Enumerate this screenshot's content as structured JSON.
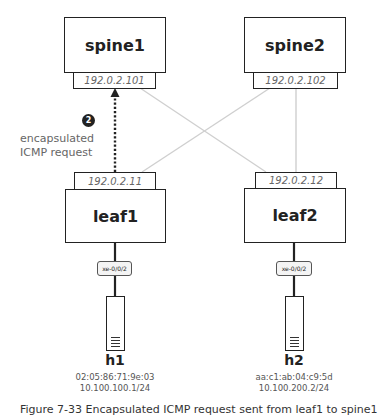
{
  "diagram": {
    "spines": [
      {
        "name": "spine1",
        "ip": "192.0.2.101"
      },
      {
        "name": "spine2",
        "ip": "192.0.2.102"
      }
    ],
    "leaves": [
      {
        "name": "leaf1",
        "ip": "192.0.2.11",
        "port": "xe-0/0/2"
      },
      {
        "name": "leaf2",
        "ip": "192.0.2.12",
        "port": "xe-0/0/2"
      }
    ],
    "hosts": [
      {
        "name": "h1",
        "mac": "02:05:86:71:9e:03",
        "ip": "10.100.100.1/24"
      },
      {
        "name": "h2",
        "mac": "aa:c1:ab:04:c9:5d",
        "ip": "10.100.200.2/24"
      }
    ],
    "step": {
      "number": "2",
      "label_line1": "encapsulated",
      "label_line2": "ICMP request"
    },
    "links": [
      {
        "from": "spine1",
        "to": "leaf1",
        "style": "dotted-arrow",
        "direction": "leaf1->spine1"
      },
      {
        "from": "spine1",
        "to": "leaf2",
        "style": "light-gray"
      },
      {
        "from": "spine2",
        "to": "leaf1",
        "style": "light-gray"
      },
      {
        "from": "spine2",
        "to": "leaf2",
        "style": "light-gray"
      },
      {
        "from": "leaf1",
        "to": "h1",
        "style": "solid"
      },
      {
        "from": "leaf2",
        "to": "h2",
        "style": "solid"
      }
    ],
    "colors": {
      "box_border": "#222222",
      "link_gray": "#cfcfcf",
      "ip_text": "#666666",
      "badge": "#222222"
    },
    "caption": "Figure 7-33  Encapsulated ICMP request sent from leaf1 to spine1"
  }
}
